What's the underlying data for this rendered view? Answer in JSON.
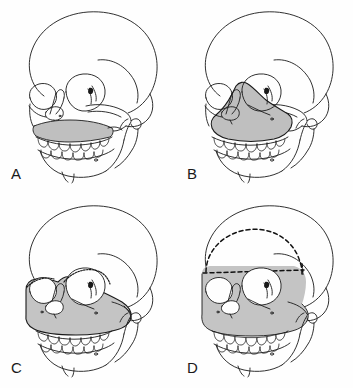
{
  "figure": {
    "background_color": "#fefefe",
    "line_color": "#1a1a1a",
    "shade_color": "#bfbfbf",
    "shade_color_light": "#cccccc",
    "dashed_line_color": "#111111",
    "columns": 2,
    "rows": 2
  },
  "panels": [
    {
      "label": "A",
      "name": "le-fort-one",
      "osteotomy": "Le Fort I",
      "shaded_region": "maxilla above upper dentition",
      "has_dashed_craniotomy": "no"
    },
    {
      "label": "B",
      "name": "le-fort-two",
      "osteotomy": "Le Fort II",
      "shaded_region": "pyramidal nasomaxillary segment",
      "has_dashed_craniotomy": "no"
    },
    {
      "label": "C",
      "name": "le-fort-three",
      "osteotomy": "Le Fort III",
      "shaded_region": "midface including zygomas and orbital floors",
      "has_dashed_craniotomy": "no"
    },
    {
      "label": "D",
      "name": "monobloc-frontofacial",
      "osteotomy": "Monobloc frontofacial advancement",
      "shaded_region": "frontal bone with entire midface",
      "has_dashed_craniotomy": "yes"
    }
  ]
}
